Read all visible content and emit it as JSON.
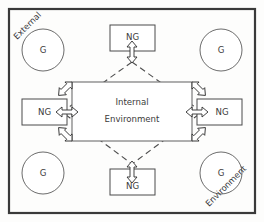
{
  "diagram": {
    "frame": {
      "name": "outer-boundary",
      "stroke_color": "#3a3a3a"
    },
    "corner_labels": [
      {
        "id": "external",
        "text": "External",
        "position": "top-left",
        "rotation_deg": -45
      },
      {
        "id": "environment",
        "text": "Environment",
        "position": "bottom-right",
        "rotation_deg": -45
      }
    ],
    "center": {
      "id": "internal-environment",
      "line1": "Internal",
      "line2": "Environment",
      "shape": "rectangle"
    },
    "ng_nodes": [
      {
        "id": "ng-top",
        "label": "NG",
        "position": "top"
      },
      {
        "id": "ng-left",
        "label": "NG",
        "position": "left"
      },
      {
        "id": "ng-right",
        "label": "NG",
        "position": "right"
      },
      {
        "id": "ng-bottom",
        "label": "NG",
        "position": "bottom"
      }
    ],
    "g_nodes": [
      {
        "id": "g-top-left",
        "label": "G",
        "position": "top-left"
      },
      {
        "id": "g-top-right",
        "label": "G",
        "position": "top-right"
      },
      {
        "id": "g-bottom-left",
        "label": "G",
        "position": "bottom-left"
      },
      {
        "id": "g-bottom-right",
        "label": "G",
        "position": "bottom-right"
      }
    ],
    "connectors": {
      "style": "dashed-diamond",
      "arrow_type": "double-headed",
      "count": 8,
      "description": "Dashed diamond linking the four NG nodes through the Internal Environment, with double-headed arrows at the diamond vertices and at each rectangle corner."
    },
    "colors": {
      "background": "#fdfdfc",
      "frame": "#3a3a3a",
      "shape_stroke": "#4a4a4a",
      "text": "#3b3b3b",
      "dashed_line": "#4d4d4d"
    }
  }
}
